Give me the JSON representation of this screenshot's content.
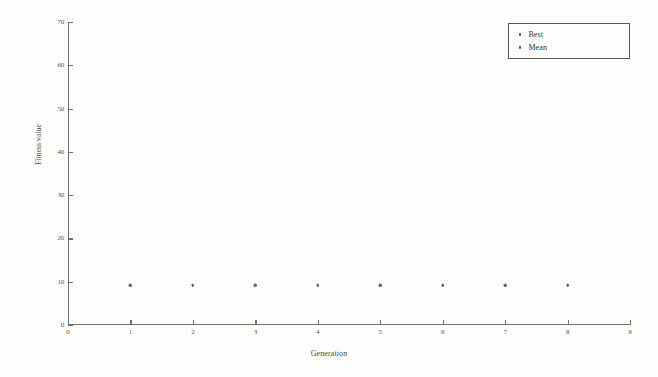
{
  "chart_data": {
    "type": "scatter",
    "title": "",
    "xlabel": "Generation",
    "ylabel": "Fitness value",
    "xlim": [
      0,
      9
    ],
    "ylim": [
      0,
      70
    ],
    "xticks": [
      0,
      1,
      2,
      3,
      4,
      5,
      6,
      7,
      8,
      9
    ],
    "yticks": [
      0,
      10,
      20,
      30,
      40,
      50,
      60,
      70
    ],
    "xtick_labels": [
      "0",
      "1",
      "2",
      "3",
      "4",
      "5",
      "6",
      "7",
      "8",
      "9"
    ],
    "ytick_labels": [
      "0",
      "10",
      "20",
      "30",
      "40",
      "50",
      "60",
      "70"
    ],
    "grid": false,
    "legend_position": "top-right",
    "x": [
      1,
      2,
      3,
      4,
      5,
      6,
      7,
      8
    ],
    "series": [
      {
        "name": "Best",
        "marker": "dot",
        "color": "#4a4a4a",
        "values": [
          9.2,
          9.2,
          9.2,
          9.2,
          9.2,
          9.2,
          9.2,
          9.2
        ]
      },
      {
        "name": "Mean",
        "marker": "dot",
        "color": "#6a6a6a",
        "values": [
          9.2,
          9.2,
          9.2,
          9.2,
          9.2,
          9.2,
          9.2,
          9.2
        ]
      }
    ]
  },
  "legend": {
    "entries": [
      {
        "label": "Best"
      },
      {
        "label": "Mean"
      }
    ]
  },
  "colors": {
    "axis": "#6e6e6e",
    "text": "#4a4a4a",
    "background": "#fdfdfc",
    "marker_best": "#4a4a4a",
    "marker_mean": "#6a6a6a"
  }
}
